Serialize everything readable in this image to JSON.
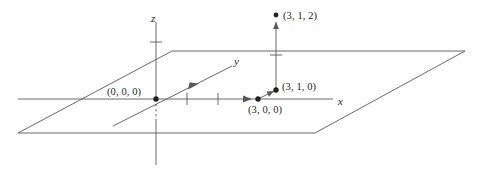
{
  "figure": {
    "type": "3d-coordinate-diagram",
    "width": 483,
    "height": 176,
    "background_color": "#ffffff",
    "stroke_color": "#58595b",
    "text_color": "#231f20"
  },
  "axes": {
    "x": {
      "label": "x",
      "label_x": 338,
      "label_y": 96,
      "line": {
        "x1": 18,
        "y1": 99,
        "x2": 333,
        "y2": 99
      },
      "ticks": [
        {
          "x": 187,
          "y": 99
        },
        {
          "x": 218,
          "y": 99
        }
      ],
      "arrow": {
        "x": 250,
        "y": 99
      }
    },
    "y": {
      "label": "y",
      "label_x": 234,
      "label_y": 56,
      "line": {
        "x1": 113,
        "y1": 126,
        "x2": 232,
        "y2": 66
      },
      "arrow": {
        "x": 196,
        "y": 84
      }
    },
    "z": {
      "label": "z",
      "label_x": 151,
      "label_y": 13,
      "line_solid_top": {
        "x1": 156,
        "y1": 22,
        "x2": 156,
        "y2": 99
      },
      "line_dashed": {
        "x1": 156,
        "y1": 99,
        "x2": 156,
        "y2": 121
      },
      "line_solid_bottom": {
        "x1": 156,
        "y1": 121,
        "x2": 156,
        "y2": 165
      },
      "ticks": [
        {
          "y": 42
        }
      ]
    }
  },
  "plane": {
    "name": "xy-plane",
    "corners": [
      {
        "x": 172,
        "y": 51
      },
      {
        "x": 465,
        "y": 51
      },
      {
        "x": 315,
        "y": 133
      },
      {
        "x": 18,
        "y": 133
      }
    ]
  },
  "points": [
    {
      "id": "origin",
      "label": "(0, 0, 0)",
      "x": 156,
      "y": 99,
      "label_x": 107,
      "label_y": 87,
      "dot": true
    },
    {
      "id": "p300",
      "label": "(3, 0, 0)",
      "x": 258,
      "y": 99,
      "label_x": 248,
      "label_y": 105,
      "dot": true
    },
    {
      "id": "p310",
      "label": "(3, 1, 0)",
      "x": 276,
      "y": 90,
      "label_x": 282,
      "label_y": 82,
      "dot": true
    },
    {
      "id": "p312",
      "label": "(3, 1, 2)",
      "x": 276,
      "y": 15,
      "label_x": 283,
      "label_y": 11,
      "dot": true
    }
  ],
  "vectors": [
    {
      "id": "x-step",
      "from": {
        "x": 156,
        "y": 99
      },
      "to": {
        "x": 258,
        "y": 99
      },
      "arrow_at": {
        "x": 250,
        "y": 99
      },
      "direction": "x"
    },
    {
      "id": "y-step",
      "from": {
        "x": 258,
        "y": 99
      },
      "to": {
        "x": 276,
        "y": 90
      },
      "direction": "y"
    },
    {
      "id": "z-step",
      "from": {
        "x": 276,
        "y": 90
      },
      "to": {
        "x": 276,
        "y": 20
      },
      "direction": "z",
      "tick_y": 55
    }
  ]
}
